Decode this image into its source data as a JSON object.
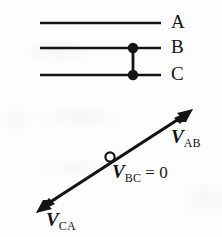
{
  "figure": {
    "ink_color": "#141414",
    "background_color": "#fdfdfd"
  },
  "line_diagram": {
    "name": "three-conductor-line-diagram",
    "conductors": [
      {
        "id": "A",
        "label": "A",
        "y": 23,
        "x_start": 40,
        "x_end": 161,
        "has_dot": false
      },
      {
        "id": "B",
        "label": "B",
        "y": 48,
        "x_start": 40,
        "x_end": 161,
        "has_dot": true
      },
      {
        "id": "C",
        "label": "C",
        "y": 75,
        "x_start": 40,
        "x_end": 161,
        "has_dot": true
      }
    ],
    "short_circuit_link": {
      "name": "bc-short-circuit-link",
      "x": 133,
      "y_top": 48,
      "y_bottom": 75,
      "dot_radius": 5
    }
  },
  "phasor_diagram": {
    "name": "phasor-voltage-diagram",
    "axis": {
      "tail_x": 37,
      "tail_y": 211,
      "head_x": 192,
      "head_y": 110,
      "double_headed": true
    },
    "origin_marker": {
      "name": "zero-voltage-node",
      "cx": 110,
      "cy": 157,
      "r": 4.5,
      "filled": false
    },
    "vectors": [
      {
        "name": "V_AB",
        "symbol": "V",
        "subscript": "AB",
        "suffix": "",
        "direction": "up-right"
      },
      {
        "name": "V_BC",
        "symbol": "V",
        "subscript": "BC",
        "suffix": " = 0",
        "direction": "none"
      },
      {
        "name": "V_CA",
        "symbol": "V",
        "subscript": "CA",
        "suffix": "",
        "direction": "down-left"
      }
    ]
  }
}
